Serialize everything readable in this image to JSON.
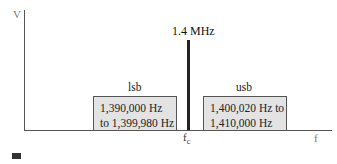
{
  "diagram": {
    "y_axis_label": "V",
    "x_axis_label": "f",
    "carrier": {
      "frequency_label": "1.4 MHz",
      "symbol": "f",
      "symbol_subscript": "c"
    },
    "lower_sideband": {
      "label": "lsb",
      "range_line1": "1,390,000 Hz",
      "range_line2": "to 1,399,980 Hz"
    },
    "upper_sideband": {
      "label": "usb",
      "range_line1": "1,400,020 Hz to",
      "range_line2": "1,410,000 Hz"
    },
    "colors": {
      "band_fill": "#e3e3e3",
      "axis": "#555555",
      "carrier_line": "#222222"
    }
  }
}
